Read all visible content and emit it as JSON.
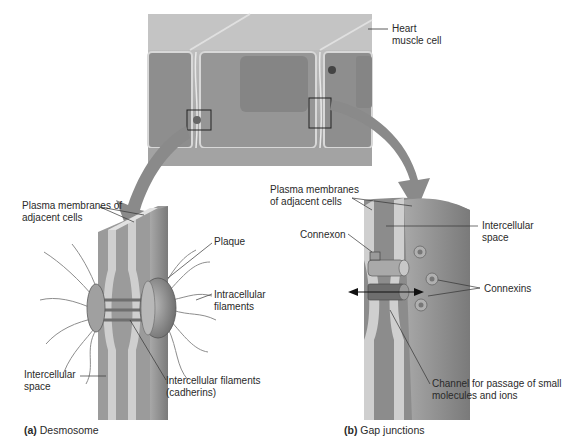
{
  "top_panel": {
    "label": "Heart muscle cell"
  },
  "desmosome": {
    "caption_letter": "(a)",
    "caption_text": "Desmosome",
    "labels": {
      "plasma_membranes": "Plasma membranes of adjacent cells",
      "plaque": "Plaque",
      "intracellular_filaments": "Intracellular filaments",
      "intercellular_space": "Intercellular space",
      "intercellular_filaments": "Intercellular filaments (cadherins)"
    }
  },
  "gap_junction": {
    "caption_letter": "(b)",
    "caption_text": "Gap junctions",
    "labels": {
      "plasma_membranes": "Plasma membranes of adjacent cells",
      "connexon": "Connexon",
      "intercellular_space": "Intercellular space",
      "connexins": "Connexins",
      "channel": "Channel for passage of small molecules and ions"
    }
  },
  "colors": {
    "cell_fill": "#8f8f8f",
    "membrane": "#c8c8c8",
    "arrow": "#8a8a8a",
    "leader": "#333333"
  }
}
